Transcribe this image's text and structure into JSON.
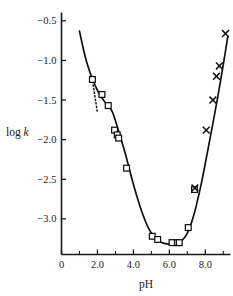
{
  "chart_data": {
    "type": "line",
    "title": "",
    "subtitle": "",
    "xlabel": "pH",
    "ylabel": "log k",
    "ylabel_parts": {
      "text": "log ",
      "italic": "k"
    },
    "xlim": [
      0.0,
      9.4
    ],
    "ylim": [
      -3.45,
      -0.42
    ],
    "grid": false,
    "legend": "none",
    "xticks": [
      0,
      2.0,
      4.0,
      6.0,
      8.0
    ],
    "xtick_labels": [
      "0",
      "2.0",
      "4.0",
      "6.0",
      "8.0"
    ],
    "x_minor_ticks": [
      1.0,
      3.0,
      5.0,
      7.0,
      9.0
    ],
    "yticks": [
      -0.5,
      -1.0,
      -1.5,
      -2.0,
      -2.5,
      -3.0
    ],
    "ytick_labels": [
      "−0.5",
      "−1.0",
      "−1.5",
      "−2.0",
      "−2.5",
      "−3.0"
    ],
    "series": [
      {
        "name": "fitted-curve",
        "marker": "none",
        "style": "solid",
        "x": [
          1.0,
          1.2,
          1.4,
          1.6,
          1.75,
          1.9,
          2.1,
          2.3,
          2.5,
          2.7,
          2.85,
          3.0,
          3.2,
          3.4,
          3.6,
          3.9,
          4.2,
          4.5,
          4.8,
          5.1,
          5.4,
          5.7,
          6.0,
          6.3,
          6.6,
          6.9,
          7.1,
          7.3,
          7.5,
          7.8,
          8.1,
          8.4,
          8.7,
          9.0,
          9.25
        ],
        "y": [
          -0.63,
          -0.84,
          -1.02,
          -1.16,
          -1.25,
          -1.33,
          -1.42,
          -1.49,
          -1.55,
          -1.6,
          -1.66,
          -1.76,
          -1.91,
          -2.06,
          -2.22,
          -2.48,
          -2.72,
          -2.93,
          -3.1,
          -3.21,
          -3.28,
          -3.31,
          -3.32,
          -3.31,
          -3.29,
          -3.22,
          -3.13,
          -3.0,
          -2.83,
          -2.53,
          -2.18,
          -1.82,
          -1.45,
          -1.05,
          -0.7
        ]
      },
      {
        "name": "acidic-and-minimum-data",
        "marker": "square",
        "style": "points",
        "x": [
          1.72,
          2.25,
          2.6,
          2.95,
          3.1,
          3.18,
          3.62,
          5.05,
          5.35,
          6.15,
          6.45,
          6.55,
          7.05,
          7.4
        ],
        "y": [
          -1.24,
          -1.43,
          -1.57,
          -1.88,
          -1.94,
          -1.98,
          -2.36,
          -3.22,
          -3.26,
          -3.3,
          -3.3,
          -3.3,
          -3.11,
          -2.63
        ]
      },
      {
        "name": "basic-data",
        "marker": "cross",
        "style": "points",
        "x": [
          7.42,
          8.05,
          8.42,
          8.62,
          8.78,
          9.12
        ],
        "y": [
          -2.61,
          -1.88,
          -1.5,
          -1.2,
          -1.07,
          -0.66
        ]
      }
    ],
    "annotations": [
      {
        "name": "tangent-dotted-line",
        "style": "dotted",
        "x": [
          1.7,
          2.0
        ],
        "y": [
          -1.22,
          -1.66
        ]
      }
    ],
    "colors": {
      "axis": "#1a1a1a",
      "curve": "#111111",
      "marker_edge": "#111111",
      "marker_face": "#ffffff",
      "background": "#ffffff"
    }
  }
}
